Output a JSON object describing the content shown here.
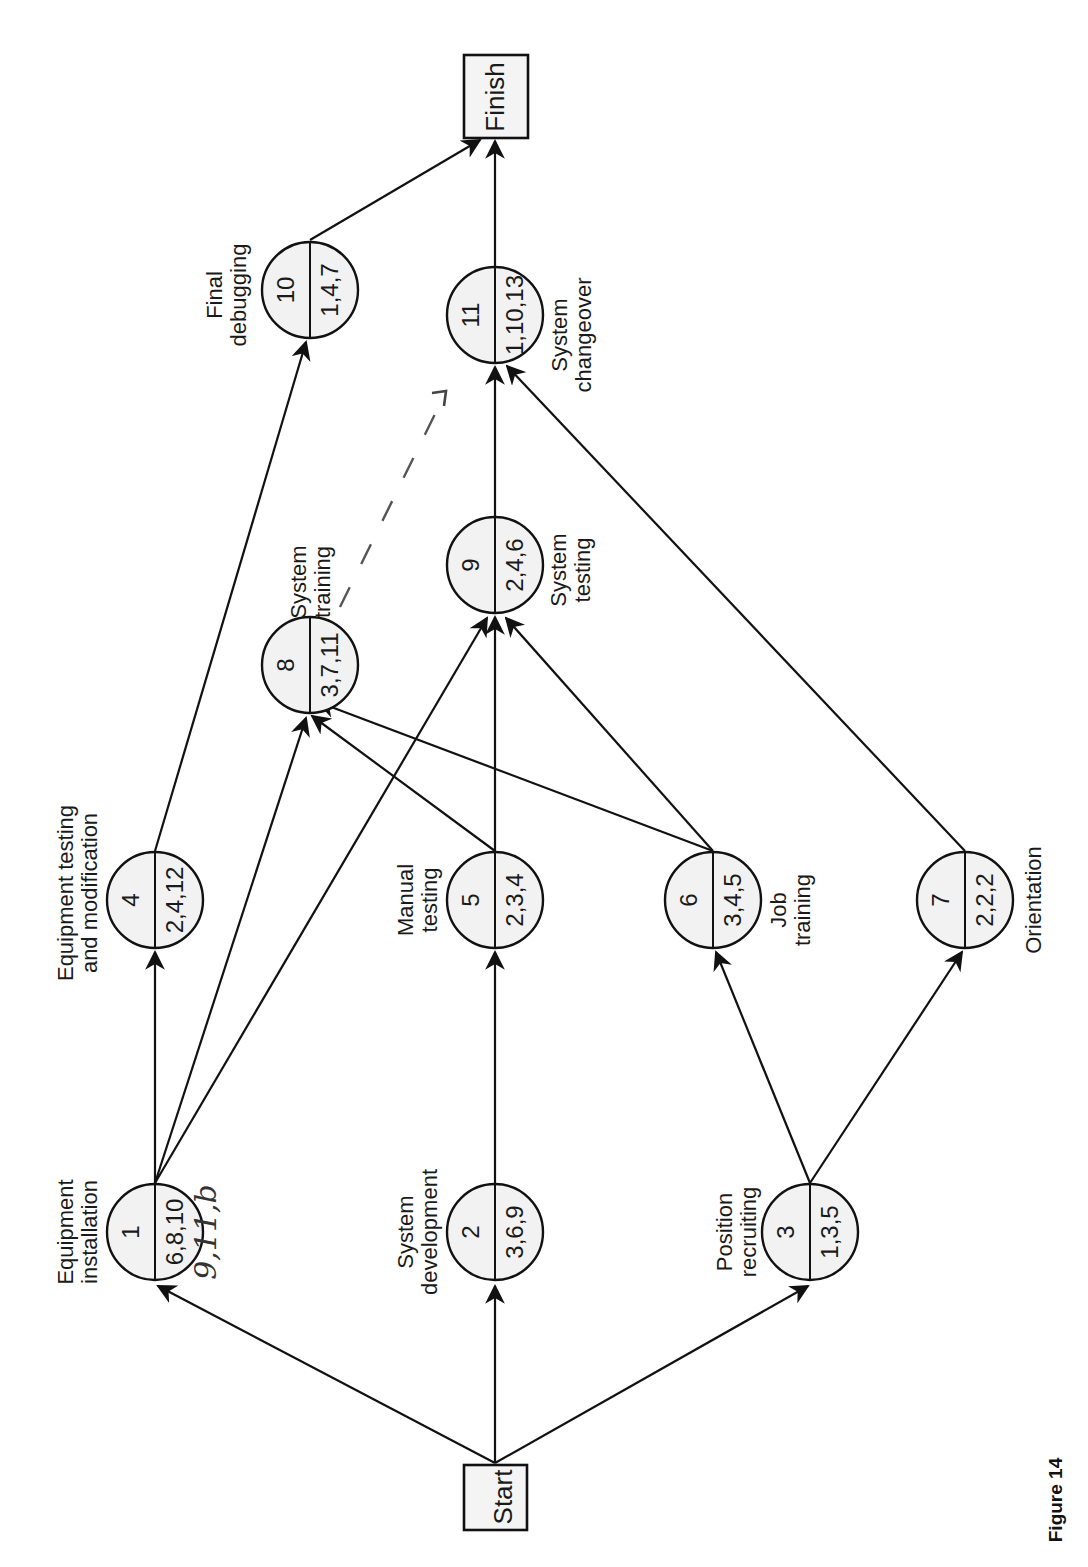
{
  "figure": {
    "caption": "Figure 14",
    "orientation": "rotated 90° counter-clockwise",
    "start_label": "Start",
    "finish_label": "Finish"
  },
  "nodes": [
    {
      "id": "1",
      "activity": "Equipment installation",
      "label_lines": [
        "Equipment",
        "installation"
      ],
      "estimates": "6,8,10",
      "annotation": "9,11,b"
    },
    {
      "id": "2",
      "activity": "System development",
      "label_lines": [
        "System",
        "development"
      ],
      "estimates": "3,6,9"
    },
    {
      "id": "3",
      "activity": "Position recruiting",
      "label_lines": [
        "Position",
        "recruiting"
      ],
      "estimates": "1,3,5"
    },
    {
      "id": "4",
      "activity": "Equipment testing and modification",
      "label_lines": [
        "Equipment testing",
        "and modification"
      ],
      "estimates": "2,4,12"
    },
    {
      "id": "5",
      "activity": "Manual testing",
      "label_lines": [
        "Manual",
        "testing"
      ],
      "estimates": "2,3,4"
    },
    {
      "id": "6",
      "activity": "Job training",
      "label_lines": [
        "Job",
        "training"
      ],
      "estimates": "3,4,5"
    },
    {
      "id": "7",
      "activity": "Orientation",
      "label_lines": [
        "Orientation"
      ],
      "estimates": "2,2,2"
    },
    {
      "id": "8",
      "activity": "System training",
      "label_lines": [
        "System",
        "training"
      ],
      "estimates": "3,7,11"
    },
    {
      "id": "9",
      "activity": "System testing",
      "label_lines": [
        "System",
        "testing"
      ],
      "estimates": "2,4,6"
    },
    {
      "id": "10",
      "activity": "Final debugging",
      "label_lines": [
        "Final",
        "debugging"
      ],
      "estimates": "1,4,7"
    },
    {
      "id": "11",
      "activity": "System changeover",
      "label_lines": [
        "System",
        "changeover"
      ],
      "estimates": "1,10,13"
    }
  ],
  "edges": [
    {
      "from": "Start",
      "to": "1"
    },
    {
      "from": "Start",
      "to": "2"
    },
    {
      "from": "Start",
      "to": "3"
    },
    {
      "from": "1",
      "to": "4"
    },
    {
      "from": "1",
      "to": "8"
    },
    {
      "from": "1",
      "to": "9"
    },
    {
      "from": "2",
      "to": "5"
    },
    {
      "from": "3",
      "to": "6"
    },
    {
      "from": "3",
      "to": "7"
    },
    {
      "from": "4",
      "to": "10"
    },
    {
      "from": "5",
      "to": "8"
    },
    {
      "from": "5",
      "to": "9"
    },
    {
      "from": "6",
      "to": "8"
    },
    {
      "from": "6",
      "to": "9"
    },
    {
      "from": "7",
      "to": "11"
    },
    {
      "from": "9",
      "to": "11"
    },
    {
      "from": "8",
      "to": "11",
      "style": "dashed-handdrawn"
    },
    {
      "from": "10",
      "to": "Finish"
    },
    {
      "from": "11",
      "to": "Finish"
    }
  ],
  "handwritten": {
    "node1_note": "9,11,b"
  }
}
